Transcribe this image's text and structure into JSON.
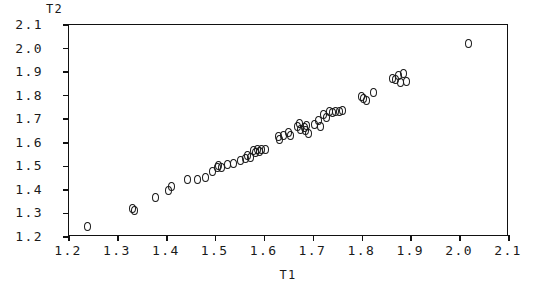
{
  "chart_data": {
    "type": "scatter",
    "title": "",
    "xlabel": "T1",
    "ylabel": "T2",
    "xlim": [
      1.2,
      2.1
    ],
    "ylim": [
      1.2,
      2.1
    ],
    "grid": false,
    "legend": null,
    "marker_symbol": "open-circle",
    "xticks": [
      "1.2",
      "1.3",
      "1.4",
      "1.5",
      "1.6",
      "1.7",
      "1.8",
      "1.9",
      "2.0",
      "2.1"
    ],
    "yticks": [
      "1.2",
      "1.3",
      "1.4",
      "1.5",
      "1.6",
      "1.7",
      "1.8",
      "1.9",
      "2.0",
      "2.1"
    ],
    "xtick_values": [
      1.2,
      1.3,
      1.4,
      1.5,
      1.6,
      1.7,
      1.8,
      1.9,
      2.0,
      2.1
    ],
    "ytick_values": [
      1.2,
      1.3,
      1.4,
      1.5,
      1.6,
      1.7,
      1.8,
      1.9,
      2.0,
      2.1
    ],
    "points": [
      [
        1.237,
        1.246
      ],
      [
        1.329,
        1.322
      ],
      [
        1.333,
        1.313
      ],
      [
        1.376,
        1.369
      ],
      [
        1.403,
        1.397
      ],
      [
        1.41,
        1.416
      ],
      [
        1.443,
        1.445
      ],
      [
        1.462,
        1.446
      ],
      [
        1.479,
        1.451
      ],
      [
        1.494,
        1.478
      ],
      [
        1.504,
        1.497
      ],
      [
        1.506,
        1.505
      ],
      [
        1.512,
        1.497
      ],
      [
        1.524,
        1.507
      ],
      [
        1.537,
        1.513
      ],
      [
        1.551,
        1.525
      ],
      [
        1.562,
        1.535
      ],
      [
        1.566,
        1.546
      ],
      [
        1.572,
        1.538
      ],
      [
        1.578,
        1.567
      ],
      [
        1.581,
        1.557
      ],
      [
        1.585,
        1.57
      ],
      [
        1.589,
        1.563
      ],
      [
        1.593,
        1.572
      ],
      [
        1.601,
        1.57
      ],
      [
        1.628,
        1.626
      ],
      [
        1.63,
        1.612
      ],
      [
        1.639,
        1.633
      ],
      [
        1.648,
        1.642
      ],
      [
        1.653,
        1.63
      ],
      [
        1.668,
        1.668
      ],
      [
        1.671,
        1.68
      ],
      [
        1.673,
        1.657
      ],
      [
        1.681,
        1.665
      ],
      [
        1.684,
        1.651
      ],
      [
        1.686,
        1.672
      ],
      [
        1.689,
        1.638
      ],
      [
        1.703,
        1.678
      ],
      [
        1.71,
        1.694
      ],
      [
        1.714,
        1.669
      ],
      [
        1.72,
        1.722
      ],
      [
        1.726,
        1.707
      ],
      [
        1.732,
        1.734
      ],
      [
        1.739,
        1.73
      ],
      [
        1.746,
        1.731
      ],
      [
        1.753,
        1.732
      ],
      [
        1.759,
        1.735
      ],
      [
        1.798,
        1.795
      ],
      [
        1.803,
        1.786
      ],
      [
        1.809,
        1.781
      ],
      [
        1.822,
        1.812
      ],
      [
        1.862,
        1.873
      ],
      [
        1.868,
        1.867
      ],
      [
        1.873,
        1.885
      ],
      [
        1.879,
        1.855
      ],
      [
        1.884,
        1.893
      ],
      [
        1.89,
        1.862
      ],
      [
        2.018,
        2.022
      ]
    ],
    "n_points": 58
  }
}
